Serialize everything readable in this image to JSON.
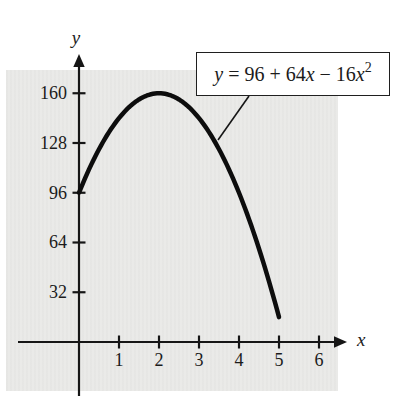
{
  "figure": {
    "axis_labels": {
      "x": "x",
      "y": "y"
    },
    "equation_box": {
      "plain": "y = 96 + 64x − 16x²",
      "parts": [
        {
          "t": "y",
          "style": "var"
        },
        {
          "t": " = 96 + 64",
          "style": "plain"
        },
        {
          "t": "x",
          "style": "var"
        },
        {
          "t": " − 16",
          "style": "plain"
        },
        {
          "t": "x",
          "style": "var"
        },
        {
          "t": "2",
          "style": "sup"
        }
      ]
    }
  },
  "chart_data": {
    "type": "line",
    "title": "",
    "xlabel": "x",
    "ylabel": "y",
    "grid": false,
    "legend_position": "none",
    "x_ticks": [
      1,
      2,
      3,
      4,
      5,
      6
    ],
    "y_ticks": [
      32,
      64,
      96,
      128,
      160
    ],
    "xlim": [
      0,
      6.7
    ],
    "ylim": [
      0,
      190
    ],
    "series": [
      {
        "name": "y = 96 + 64x − 16x²",
        "function": {
          "type": "polynomial",
          "coefficients": [
            96,
            64,
            -16
          ],
          "domain": [
            0,
            5
          ]
        },
        "x": [
          0,
          0.5,
          1,
          1.5,
          2,
          2.5,
          3,
          3.5,
          4,
          4.5,
          5
        ],
        "y": [
          96,
          124,
          144,
          156,
          160,
          156,
          144,
          124,
          96,
          60,
          16
        ]
      }
    ],
    "key_points": {
      "y_intercept": [
        0,
        96
      ],
      "vertex": [
        2,
        160
      ],
      "curve_end": [
        5,
        16
      ]
    },
    "annotations": [
      {
        "type": "label-box",
        "text": "y = 96 + 64x − 16x²",
        "points_to": "curve near x = 3.5"
      }
    ]
  },
  "style": {
    "curve_color": "#0d0d0d",
    "axis_color": "#161616",
    "panel_color": "#eaeae8",
    "text_color": "#1b1b1b",
    "box_bg": "#ffffff",
    "box_border": "#1f1f1f"
  }
}
